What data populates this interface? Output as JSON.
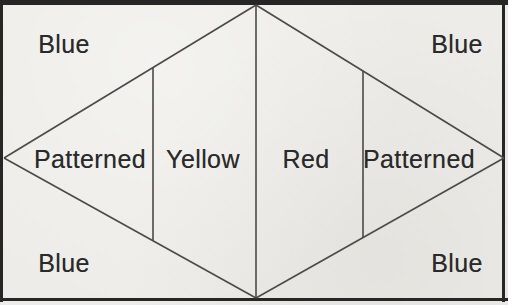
{
  "figure": {
    "background_color": "#edece8",
    "line_color": "#4a4a4a",
    "border_color": "#262626",
    "text_color": "#2a2a2a"
  },
  "labels": {
    "blue_top_left": "Blue",
    "blue_top_right": "Blue",
    "blue_bottom_left": "Blue",
    "blue_bottom_right": "Blue",
    "patterned_left": "Patterned",
    "yellow": "Yellow",
    "red": "Red",
    "patterned_right": "Patterned"
  }
}
